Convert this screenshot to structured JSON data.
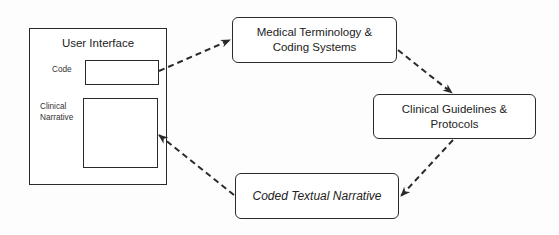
{
  "user_interface": {
    "title": "User Interface",
    "code_label": "Code",
    "narrative_label": "Clinical\nNarrative",
    "code_field_value": "",
    "narrative_field_value": ""
  },
  "nodes": {
    "medical": "Medical Terminology &\nCoding Systems",
    "clinical": "Clinical Guidelines &\nProtocols",
    "coded": "Coded Textual Narrative"
  },
  "edges": [
    {
      "from": "code-field",
      "to": "medical-node",
      "style": "dashed"
    },
    {
      "from": "medical-node",
      "to": "clinical-node",
      "style": "dashed"
    },
    {
      "from": "clinical-node",
      "to": "coded-node",
      "style": "dashed"
    },
    {
      "from": "coded-node",
      "to": "narrative-field",
      "style": "dashed"
    }
  ],
  "colors": {
    "stroke": "#2a2a2a",
    "background": "#ffffff",
    "text": "#222222"
  }
}
